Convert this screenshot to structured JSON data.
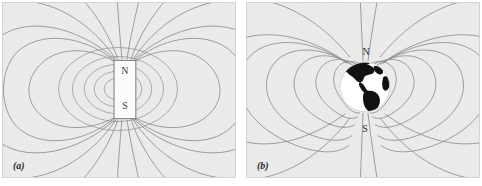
{
  "figure": {
    "background_color": "#ffffff",
    "panel_background_color": "#ececed",
    "fieldline_color": "#8d8d90",
    "label_color": "#3a3a3a"
  },
  "panels": [
    {
      "id": "a",
      "caption": "(a)",
      "subject": "bar-magnet",
      "poles": {
        "north": "N",
        "south": "S"
      },
      "magnet": {
        "fill_color": "#fbfbfb",
        "border_color": "#6d6d70"
      }
    },
    {
      "id": "b",
      "caption": "(b)",
      "subject": "earth-globe",
      "poles": {
        "north": "N",
        "south": "S"
      },
      "globe": {
        "disc_color": "#ffffff",
        "land_color": "#111111"
      }
    }
  ]
}
